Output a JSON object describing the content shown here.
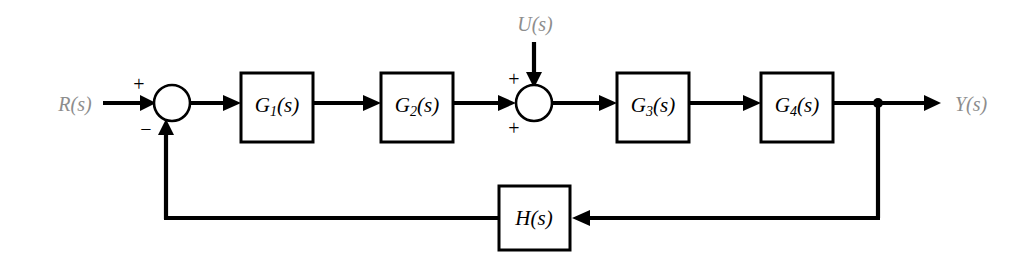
{
  "diagram": {
    "background_color": "#ffffff",
    "line_color": "#000000",
    "signal_label_color": "#8d8d8d",
    "block_label_color": "#000000",
    "signals": {
      "input": "R(s)",
      "disturbance": "U(s)",
      "output": "Y(s)"
    },
    "blocks": {
      "g1": {
        "name": "G",
        "subscript": "1",
        "arg": "(s)",
        "label": "G1(s)"
      },
      "g2": {
        "name": "G",
        "subscript": "2",
        "arg": "(s)",
        "label": "G2(s)"
      },
      "g3": {
        "name": "G",
        "subscript": "3",
        "arg": "(s)",
        "label": "G3(s)"
      },
      "g4": {
        "name": "G",
        "subscript": "4",
        "arg": "(s)",
        "label": "G4(s)"
      },
      "h": {
        "name": "H",
        "subscript": "",
        "arg": "(s)",
        "label": "H(s)"
      }
    },
    "summing_junction_1": {
      "sign_input": "+",
      "sign_feedback": "−"
    },
    "summing_junction_2": {
      "sign_forward": "+",
      "sign_disturbance": "+"
    }
  }
}
